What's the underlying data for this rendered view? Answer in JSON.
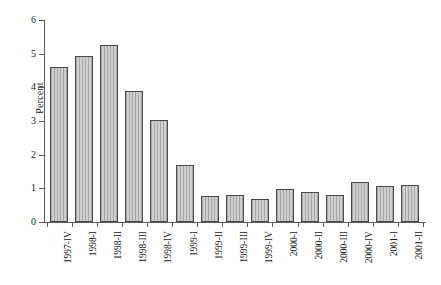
{
  "chart_data": {
    "type": "bar",
    "title": "",
    "xlabel": "",
    "ylabel": "Percent",
    "ylim": [
      0,
      6
    ],
    "ytick_labels": [
      "0",
      "1",
      "2",
      "3",
      "4",
      "5",
      "6"
    ],
    "ytick_values": [
      0,
      1,
      2,
      3,
      4,
      5,
      6
    ],
    "grid": false,
    "legend": false,
    "categories": [
      "1997-IV",
      "1998-I",
      "1998-II",
      "1998-III",
      "1998-IV",
      "1999-I",
      "1999-II",
      "1999-III",
      "1999-IV",
      "2000-I",
      "2000-II",
      "2000-III",
      "2000-IV",
      "2001-I",
      "2001-II"
    ],
    "values": [
      4.6,
      4.92,
      5.25,
      3.89,
      3.03,
      1.7,
      0.78,
      0.81,
      0.68,
      0.98,
      0.89,
      0.8,
      1.19,
      1.07,
      1.1
    ],
    "bar_color": "#b9b9b9",
    "bar_edge_color": "#4a4a4a",
    "axis_color": "#5c5c5c",
    "background_color": "#ffffff"
  }
}
